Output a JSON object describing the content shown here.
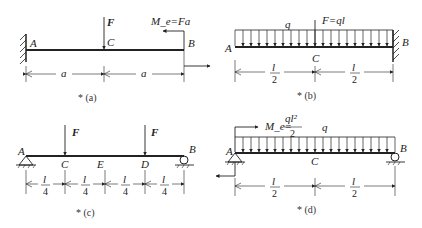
{
  "figures": [
    {
      "id": "a",
      "caption": "* (a)",
      "points": [
        "A",
        "C",
        "B"
      ],
      "force_label": "F",
      "moment_label": "M_e=Fa",
      "dims": [
        "a",
        "a"
      ],
      "support": "fixed-left"
    },
    {
      "id": "b",
      "caption": "* (b)",
      "points": [
        "A",
        "C",
        "B"
      ],
      "load_label": "q",
      "force_label": "F=ql",
      "dims": [
        {
          "num": "l",
          "den": "2"
        },
        {
          "num": "l",
          "den": "2"
        }
      ],
      "support": "fixed-right"
    },
    {
      "id": "c",
      "caption": "* (c)",
      "points": [
        "A",
        "C",
        "E",
        "D",
        "B"
      ],
      "force_labels": [
        "F",
        "F"
      ],
      "dims": [
        {
          "num": "l",
          "den": "4"
        },
        {
          "num": "l",
          "den": "4"
        },
        {
          "num": "l",
          "den": "4"
        },
        {
          "num": "l",
          "den": "4"
        }
      ],
      "support": "pin-left-roller-right"
    },
    {
      "id": "d",
      "caption": "* (d)",
      "points": [
        "A",
        "C",
        "B"
      ],
      "load_label": "q",
      "moment_label": "M_e=",
      "moment_value": {
        "num": "ql²",
        "den": "2"
      },
      "dims": [
        {
          "num": "l",
          "den": "2"
        },
        {
          "num": "l",
          "den": "2"
        }
      ],
      "support": "pin-left-roller-right"
    }
  ]
}
